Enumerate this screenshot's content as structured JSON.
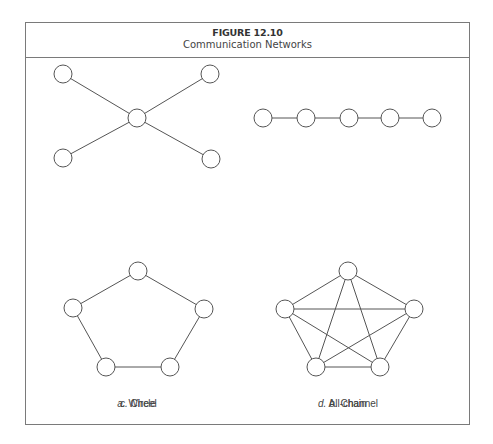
{
  "figure": {
    "number": "FIGURE 12.10",
    "title": "Communication Networks"
  },
  "panels": [
    {
      "id": "wheel",
      "letter": "a.",
      "name": "Wheel",
      "caption_pos": [
        137,
        398
      ],
      "nodes": [
        [
          63,
          74
        ],
        [
          210,
          74
        ],
        [
          137,
          118
        ],
        [
          63,
          158
        ],
        [
          211,
          159
        ]
      ],
      "edges": [
        [
          0,
          2
        ],
        [
          1,
          2
        ],
        [
          3,
          2
        ],
        [
          4,
          2
        ]
      ]
    },
    {
      "id": "chain",
      "letter": "b.",
      "name": "Chain",
      "caption_pos": [
        348,
        398
      ],
      "nodes": [
        [
          263,
          118
        ],
        [
          306,
          118
        ],
        [
          349,
          118
        ],
        [
          390,
          118
        ],
        [
          432,
          118
        ]
      ],
      "edges": [
        [
          0,
          1
        ],
        [
          1,
          2
        ],
        [
          2,
          3
        ],
        [
          3,
          4
        ]
      ]
    },
    {
      "id": "circle",
      "letter": "c.",
      "name": "Circle",
      "caption_pos": [
        138,
        398
      ],
      "nodes": [
        [
          138,
          271
        ],
        [
          204,
          309
        ],
        [
          170,
          367
        ],
        [
          106,
          367
        ],
        [
          73,
          308
        ]
      ],
      "edges": [
        [
          0,
          1
        ],
        [
          1,
          2
        ],
        [
          2,
          3
        ],
        [
          3,
          4
        ],
        [
          4,
          0
        ]
      ]
    },
    {
      "id": "all-channel",
      "letter": "d.",
      "name": "All-channel",
      "caption_pos": [
        348,
        398
      ],
      "nodes": [
        [
          348,
          271
        ],
        [
          414,
          309
        ],
        [
          380,
          367
        ],
        [
          316,
          367
        ],
        [
          285,
          309
        ]
      ],
      "edges": [
        [
          0,
          1
        ],
        [
          0,
          2
        ],
        [
          0,
          3
        ],
        [
          0,
          4
        ],
        [
          1,
          2
        ],
        [
          1,
          3
        ],
        [
          1,
          4
        ],
        [
          2,
          3
        ],
        [
          2,
          4
        ],
        [
          3,
          4
        ]
      ]
    }
  ],
  "style": {
    "node_radius": 9,
    "stroke": "#555555",
    "frame": "#7a7a7a"
  }
}
